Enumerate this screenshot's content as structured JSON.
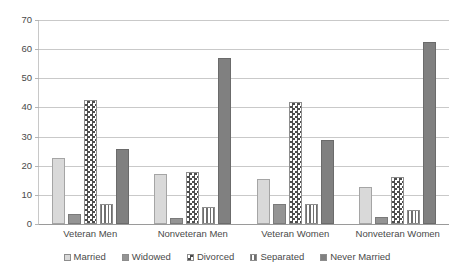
{
  "chart_data": {
    "type": "bar",
    "title": "",
    "subtitle": "",
    "xlabel": "",
    "ylabel": "",
    "ylim": [
      0,
      70
    ],
    "ytick_step": 10,
    "yticks": [
      70,
      60,
      50,
      40,
      30,
      20,
      10,
      0
    ],
    "grid": true,
    "legend_position": "bottom",
    "categories": [
      "Veteran Men",
      "Nonveteran Men",
      "Veteran Women",
      "Nonveteran Women"
    ],
    "series": [
      {
        "name": "Married",
        "pattern": "solid-light-gray",
        "color": "#d9d9d9",
        "values": [
          22.6,
          17.0,
          15.6,
          12.8
        ]
      },
      {
        "name": "Widowed",
        "pattern": "solid-medium-gray",
        "color": "#949494",
        "values": [
          3.5,
          2.0,
          6.8,
          2.3
        ]
      },
      {
        "name": "Divorced",
        "pattern": "checkerboard",
        "color": "#4d4d4d",
        "values": [
          42.4,
          17.8,
          42.0,
          16.3
        ]
      },
      {
        "name": "Separated",
        "pattern": "vertical-stripes",
        "color": "#6e6e6e",
        "values": [
          6.8,
          6.0,
          7.0,
          4.8
        ]
      },
      {
        "name": "Never Married",
        "pattern": "solid-dark-gray",
        "color": "#808080",
        "values": [
          25.6,
          57.0,
          28.8,
          62.5
        ]
      }
    ]
  },
  "legend": {
    "items": [
      {
        "label": "Married"
      },
      {
        "label": "Widowed"
      },
      {
        "label": "Divorced"
      },
      {
        "label": "Separated"
      },
      {
        "label": "Never Married"
      }
    ]
  }
}
